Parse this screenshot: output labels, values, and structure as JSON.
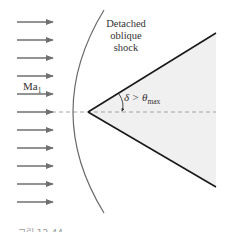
{
  "figure": {
    "shock_label_lines": [
      "Detached",
      "oblique",
      "shock"
    ],
    "mach": {
      "symbol": "Ma",
      "subscript": "1"
    },
    "angle": {
      "text": "δ > θ",
      "subscript": "max"
    },
    "caption": "그림 12-44"
  },
  "colors": {
    "arrow": "#6f6f6f",
    "shock": "#6a6a6a",
    "wedge_edge": "#1a1a1a",
    "wedge_fill": "#f0f0f0",
    "centerline": "#9a9a9a",
    "text": "#333333"
  },
  "geometry": {
    "arrows_y": [
      22,
      40,
      58,
      76,
      94,
      112,
      130,
      148,
      166,
      184,
      202
    ],
    "arrow_x_start": 17,
    "arrow_x_end": 53,
    "wedge_apex": [
      88,
      112
    ],
    "wedge_top": [
      216,
      33
    ],
    "wedge_bottom": [
      216,
      187
    ],
    "centerline_y": 112
  }
}
